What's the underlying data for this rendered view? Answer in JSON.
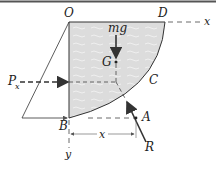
{
  "diagram": {
    "labels": {
      "O": "O",
      "D": "D",
      "x_axis": "x",
      "mg": "mg",
      "G": "G",
      "C": "C",
      "Px_main": "P",
      "Px_sub": "x",
      "A": "A",
      "B": "B",
      "x_dim": "x",
      "R": "R",
      "y_axis": "y"
    },
    "colors": {
      "fluid_fill": "#dcdcdc",
      "line": "#333333",
      "border": "#555555"
    }
  }
}
